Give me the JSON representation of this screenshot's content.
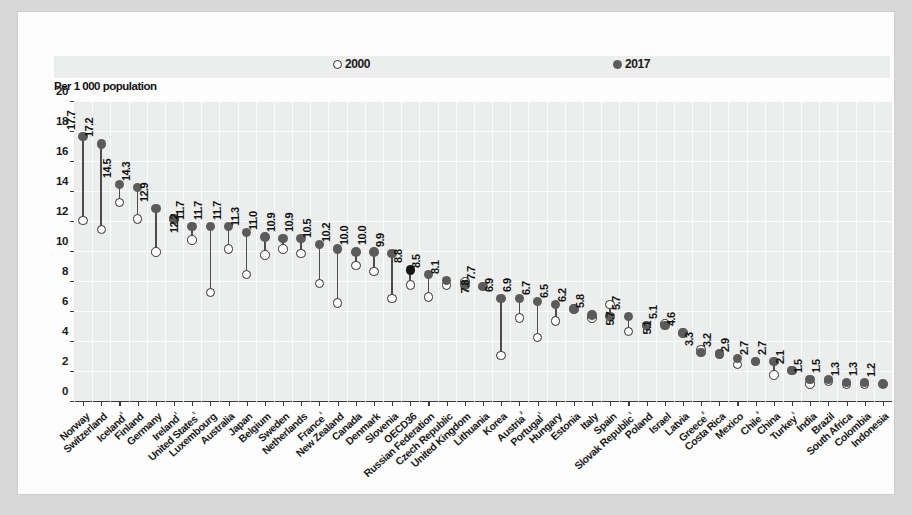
{
  "chart_data": {
    "type": "scatter",
    "title": "",
    "subtitle": "",
    "xlabel": "",
    "ylabel": "Per 1 000 population",
    "ylim": [
      0,
      20
    ],
    "ytick_step": 2,
    "yticks": [
      "0",
      "2",
      "4",
      "6",
      "8",
      "10",
      "12",
      "14",
      "16",
      "18",
      "20"
    ],
    "grid": true,
    "legend_position": "top-center",
    "legend": [
      {
        "name": "2000",
        "marker": "open-circle",
        "color": "#fdfdfd",
        "edge": "#2b2b2b"
      },
      {
        "name": "2017",
        "marker": "filled-circle",
        "color": "#5b5b5b"
      }
    ],
    "highlight_category": "OECD36",
    "highlight_color": "#151515",
    "categories": [
      "Norway",
      "Switzerland",
      "Iceland¹",
      "Finland",
      "Germany",
      "Ireland¹",
      "United States¹",
      "Luxembourg",
      "Australia",
      "Japan",
      "Belgium",
      "Sweden",
      "Netherlands",
      "France¹",
      "New Zealand",
      "Canada",
      "Denmark",
      "Slovenia",
      "OECD36",
      "Russian Federation",
      "Czech Republic",
      "United Kingdom",
      "Lithuania",
      "Korea",
      "Austria²",
      "Portugal¹",
      "Hungary",
      "Estonia",
      "Italy",
      "Spain",
      "Slovak Republic¹",
      "Poland",
      "Israel",
      "Latvia",
      "Greece²",
      "Costa Rica",
      "Mexico",
      "Chile³",
      "China",
      "Turkey¹",
      "India",
      "Brazil",
      "South Africa",
      "Colombia",
      "Indonesia"
    ],
    "series": [
      {
        "name": "2017",
        "values": [
          17.7,
          17.2,
          14.5,
          14.3,
          12.9,
          12.2,
          11.7,
          11.7,
          11.7,
          11.3,
          11.0,
          10.9,
          10.9,
          10.5,
          10.2,
          10.0,
          10.0,
          9.9,
          8.8,
          8.5,
          8.1,
          7.8,
          7.7,
          6.9,
          6.9,
          6.7,
          6.5,
          6.2,
          5.8,
          5.7,
          5.7,
          5.1,
          5.1,
          4.6,
          3.3,
          3.2,
          2.9,
          2.7,
          2.7,
          2.1,
          1.5,
          1.5,
          1.3,
          1.3,
          1.2
        ],
        "labels": [
          "17.7",
          "17.2",
          "14.5",
          "14.3",
          "12.9",
          "12.2",
          "11.7",
          "11.7",
          "11.7",
          "11.3",
          "11.0",
          "10.9",
          "10.9",
          "10.5",
          "10.2",
          "10.0",
          "10.0",
          "9.9",
          "8.8",
          "8.5",
          "8.1",
          "7.8",
          "7.7",
          "6.9",
          "6.9",
          "6.7",
          "6.5",
          "6.2",
          "5.8",
          "5.7",
          "5.7",
          "5.1",
          "5.1",
          "4.6",
          "3.3",
          "3.2",
          "2.9",
          "2.7",
          "2.7",
          "2.1",
          "1.5",
          "1.5",
          "1.3",
          "1.3",
          "1.2"
        ]
      },
      {
        "name": "2000",
        "values": [
          12.1,
          11.5,
          13.3,
          12.2,
          10.0,
          12.2,
          10.8,
          7.3,
          10.2,
          8.5,
          9.8,
          10.2,
          9.9,
          7.9,
          6.6,
          9.1,
          8.7,
          6.9,
          7.8,
          7.0,
          7.8,
          8.0,
          null,
          3.1,
          5.6,
          4.3,
          5.4,
          6.2,
          5.6,
          6.5,
          4.7,
          5.1,
          5.2,
          4.6,
          3.5,
          3.2,
          2.5,
          2.7,
          1.8,
          2.1,
          1.2,
          1.4,
          1.2,
          1.2,
          null
        ]
      }
    ],
    "label_positions": [
      "above",
      "above",
      "above",
      "above",
      "above",
      "below",
      "above",
      "above",
      "above",
      "above",
      "above",
      "above",
      "above",
      "above",
      "above",
      "above",
      "above",
      "above",
      "above",
      "above",
      "above",
      "below",
      "above",
      "above",
      "above",
      "above",
      "above",
      "above",
      "above",
      "below",
      "above",
      "below",
      "above",
      "above",
      "above",
      "above",
      "above",
      "above",
      "above",
      "above",
      "above",
      "above",
      "above",
      "above",
      "above"
    ]
  },
  "legend": {
    "item_2000": "2000",
    "item_2017": "2017"
  },
  "axis": {
    "y_title": "Per 1 000 population"
  }
}
